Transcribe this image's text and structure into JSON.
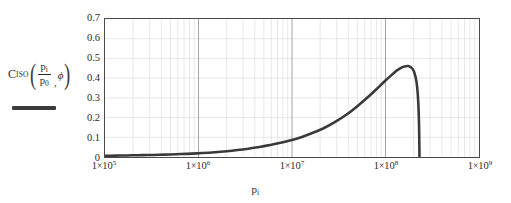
{
  "chart_data": {
    "type": "line",
    "title": "",
    "xlabel": "p i",
    "ylabel": "",
    "xscale": "log",
    "yscale": "linear",
    "xlim": [
      100000,
      1000000000
    ],
    "ylim": [
      0,
      0.7
    ],
    "grid": true,
    "legend_position": "left-outside",
    "x_tick_labels": [
      "1×10⁵",
      "1×10⁶",
      "1×10⁷",
      "1×10⁸",
      "1×10⁹"
    ],
    "x_tick_values": [
      100000,
      1000000,
      10000000,
      100000000,
      1000000000
    ],
    "y_tick_labels": [
      "0.7",
      "0.6",
      "0.5",
      "0.4",
      "0.3",
      "0.2",
      "0.1",
      "0"
    ],
    "y_tick_values": [
      0.7,
      0.6,
      0.5,
      0.4,
      0.3,
      0.2,
      0.1,
      0
    ],
    "series": [
      {
        "name": "C_ISO(p_i/p_0, phi)",
        "color": "#3a3a3a",
        "line_width": 2.6,
        "x": [
          100000,
          130000,
          170000,
          220000,
          290000,
          380000,
          500000,
          650000,
          850000,
          1100000,
          1500000,
          2000000,
          2600000,
          3400000,
          4500000,
          6000000,
          8000000,
          10000000,
          13000000,
          17000000,
          22000000,
          29000000,
          38000000,
          50000000,
          65000000,
          85000000,
          100000000,
          115000000,
          130000000,
          145000000,
          160000000,
          175000000,
          190000000,
          200000000,
          210000000,
          218000000,
          224000000,
          228000000,
          230000000,
          231000000
        ],
        "y": [
          0.006,
          0.007,
          0.008,
          0.009,
          0.01,
          0.011,
          0.013,
          0.015,
          0.017,
          0.02,
          0.024,
          0.029,
          0.035,
          0.042,
          0.051,
          0.062,
          0.075,
          0.086,
          0.103,
          0.124,
          0.147,
          0.178,
          0.214,
          0.258,
          0.304,
          0.356,
          0.388,
          0.414,
          0.436,
          0.451,
          0.459,
          0.461,
          0.452,
          0.437,
          0.404,
          0.356,
          0.28,
          0.18,
          0.07,
          0.0
        ]
      }
    ],
    "peak": {
      "x": 175000000,
      "y": 0.461
    },
    "cutoff_x": 231000000,
    "colors": {
      "curve": "#3a3a3a",
      "frame": "#4a4a4a",
      "grid_major": "#9a9a9a",
      "grid_minor": "#dedede",
      "text": "#2b2b2b",
      "background": "#ffffff"
    }
  },
  "legend": {
    "symbol": "C",
    "symbol_subscript": "ISO",
    "open_paren": "(",
    "numerator": "p",
    "numerator_subscript": "i",
    "denominator": "p",
    "denominator_subscript": "0",
    "separator": ",",
    "second_arg": "ϕ",
    "close_paren": ")"
  },
  "axis": {
    "x_title_symbol": "p",
    "x_title_subscript": "i"
  }
}
